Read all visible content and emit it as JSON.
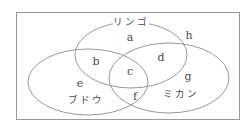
{
  "diagram": {
    "type": "venn-3-set",
    "colors": {
      "frame": "#9a9a9a",
      "stroke": "#8c8c8c",
      "text": "#4a4a4a",
      "background": "#ffffff"
    },
    "sets": [
      {
        "id": "apple",
        "label": "リンゴ"
      },
      {
        "id": "grape",
        "label": "ブドウ"
      },
      {
        "id": "orange",
        "label": "ミカン"
      }
    ],
    "regions": {
      "a": "a",
      "b": "b",
      "c": "c",
      "d": "d",
      "e": "e",
      "f": "f",
      "g": "g",
      "h": "h"
    }
  }
}
